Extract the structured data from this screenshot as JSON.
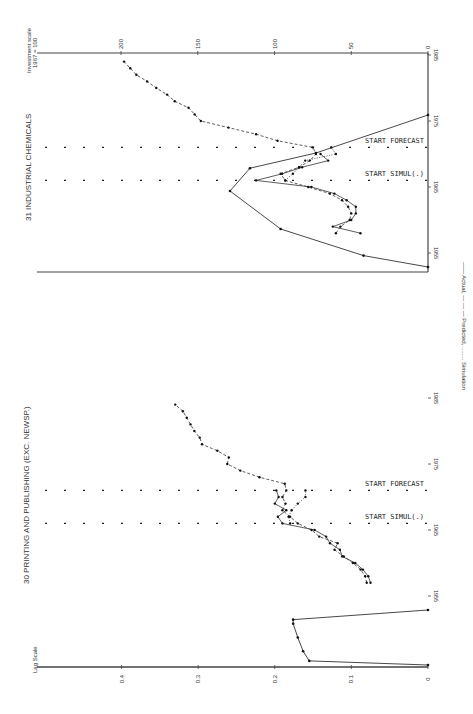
{
  "chart_data": [
    {
      "type": "line",
      "panel": "top",
      "title": "31 INDUSTRIAL CHEMICALS",
      "ylabel": "Investment scale 1967 = 100",
      "ylabel_lines": [
        "Investment scale",
        "1967 = 100"
      ],
      "xlabel": "Year",
      "orientation": "rotated 90° clockwise (time runs bottom-to-top along right edge, value increases to the left)",
      "value_ticks": [
        0,
        50,
        100,
        150,
        200
      ],
      "value_tick_labels": [
        "0",
        "50",
        "100",
        "150",
        "200"
      ],
      "year_ticks": [
        1955,
        1965,
        1975,
        1985
      ],
      "year_tick_labels": [
        "1955",
        "1965",
        "1975",
        "1985"
      ],
      "ylim": [
        0,
        245
      ],
      "xlim": [
        1950,
        1985
      ],
      "markers": [
        {
          "label": "START SIMUL(.)",
          "year": 1966
        },
        {
          "label": "START FORECAST",
          "year": 1971
        }
      ],
      "inset_curve": {
        "description": "Lag distribution (unlabeled inset)",
        "points": [
          [
            0.0,
            0
          ],
          [
            0.3,
            42
          ],
          [
            1.0,
            96
          ],
          [
            2.0,
            129
          ],
          [
            2.6,
            116
          ],
          [
            3.0,
            73
          ],
          [
            4.0,
            0
          ]
        ]
      },
      "series": [
        {
          "name": "Actual",
          "style": "solid",
          "x": [
            1958,
            1959,
            1960,
            1961,
            1962,
            1963,
            1964,
            1965,
            1966,
            1967,
            1968,
            1969,
            1970
          ],
          "y": [
            44,
            62,
            50,
            47,
            47,
            53,
            61,
            76,
            112,
            95,
            82,
            65,
            70
          ]
        },
        {
          "name": "Predicted",
          "style": "dashed",
          "x": [
            1958,
            1959,
            1960,
            1961,
            1962,
            1963,
            1964,
            1965,
            1966,
            1967,
            1968,
            1969,
            1970,
            1971,
            1972,
            1973,
            1974,
            1975,
            1976,
            1977,
            1978,
            1979,
            1980,
            1981,
            1982,
            1983,
            1984
          ],
          "y": [
            60,
            57,
            51,
            50,
            52,
            56,
            64,
            78,
            93,
            96,
            84,
            77,
            73,
            75,
            98,
            112,
            130,
            148,
            152,
            156,
            165,
            170,
            177,
            183,
            190,
            194,
            198
          ]
        },
        {
          "name": "Simulation",
          "style": "dotted",
          "x": [
            1966,
            1967,
            1968,
            1969,
            1970,
            1971
          ],
          "y": [
            93,
            88,
            84,
            80,
            60,
            63
          ]
        }
      ]
    },
    {
      "type": "line",
      "panel": "bottom",
      "title": "30 PRINTING AND PUBLISHING (EXC. NEWSP.)",
      "ylabel": "Lag Scale",
      "xlabel": "Year",
      "orientation": "rotated 90° clockwise (time runs bottom-to-top along right edge, value increases to the left)",
      "value_ticks": [
        0,
        0.1,
        0.2,
        0.3,
        0.4
      ],
      "value_tick_labels": [
        "0",
        "0.1",
        "0.2",
        "0.3",
        "0.4"
      ],
      "year_ticks": [
        1955,
        1965,
        1975,
        1985
      ],
      "year_tick_labels": [
        "1955",
        "1965",
        "1975",
        "1985"
      ],
      "ylim": [
        0,
        0.5
      ],
      "xlim": [
        1950,
        1985
      ],
      "markers": [
        {
          "label": "START SIMUL(.)",
          "year": 1966
        },
        {
          "label": "START FORECAST",
          "year": 1971
        }
      ],
      "inset_curve": {
        "description": "Lag distribution (unlabeled inset)",
        "points": [
          [
            0.0,
            0
          ],
          [
            0.3,
            0.155
          ],
          [
            1.0,
            0.163
          ],
          [
            2.0,
            0.17
          ],
          [
            3.0,
            0.176
          ],
          [
            3.3,
            0.176
          ],
          [
            4.0,
            0
          ]
        ]
      },
      "series": [
        {
          "name": "Actual",
          "style": "solid",
          "x": [
            1957,
            1958,
            1959,
            1960,
            1961,
            1962,
            1963,
            1964,
            1965,
            1966,
            1967,
            1968,
            1969,
            1970,
            1971
          ],
          "y": [
            0.075,
            0.078,
            0.085,
            0.095,
            0.112,
            0.115,
            0.128,
            0.133,
            0.148,
            0.19,
            0.196,
            0.185,
            0.2,
            0.195,
            0.198
          ]
        },
        {
          "name": "Predicted",
          "style": "dashed",
          "x": [
            1957,
            1958,
            1959,
            1960,
            1961,
            1962,
            1963,
            1964,
            1965,
            1966,
            1967,
            1968,
            1969,
            1970,
            1971,
            1972,
            1973,
            1974,
            1975,
            1976,
            1977,
            1978,
            1979,
            1980,
            1981,
            1982,
            1983,
            1984
          ],
          "y": [
            0.08,
            0.082,
            0.088,
            0.098,
            0.11,
            0.122,
            0.118,
            0.142,
            0.152,
            0.17,
            0.18,
            0.19,
            0.186,
            0.19,
            0.185,
            0.187,
            0.22,
            0.245,
            0.262,
            0.26,
            0.275,
            0.295,
            0.298,
            0.305,
            0.31,
            0.315,
            0.32,
            0.33
          ]
        },
        {
          "name": "Simulation",
          "style": "dotted",
          "x": [
            1966,
            1967,
            1968,
            1969,
            1970,
            1971
          ],
          "y": [
            0.18,
            0.182,
            0.178,
            0.17,
            0.16,
            0.16
          ]
        }
      ]
    }
  ],
  "legend": {
    "text": "—— Actual,  — — — Predicted, ........ Simulation",
    "entries": [
      "Actual",
      "Predicted",
      "Simulation"
    ]
  },
  "layout": {
    "top": {
      "value_axis_y": 53,
      "base_y": 272,
      "zero_x": 428,
      "px_per_unit": 1.535,
      "year_1985_y": 55,
      "px_per_year": 6.6,
      "inset": {
        "top_y": 115,
        "bottom_y": 267,
        "zero_x": 428,
        "scale": 1.535
      }
    },
    "bottom": {
      "value_axis_y": 667,
      "base_y": 667,
      "zero_x": 428,
      "px_per_unit": 766,
      "year_1985_y": 398,
      "px_per_year": 6.6,
      "inset": {
        "top_y": 610,
        "bottom_y": 665,
        "zero_x": 428,
        "scale": 766
      }
    }
  }
}
